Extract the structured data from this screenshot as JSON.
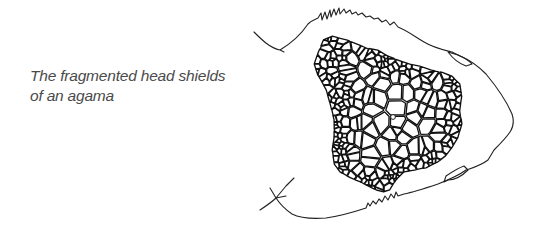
{
  "figure": {
    "caption_lines": [
      "The fragmented head shields",
      "of an agama"
    ],
    "illustration": "agama-head-scales-line-drawing",
    "colors": {
      "background": "#ffffff",
      "ink": "#111111",
      "caption_text": "#4a4a4a"
    }
  }
}
